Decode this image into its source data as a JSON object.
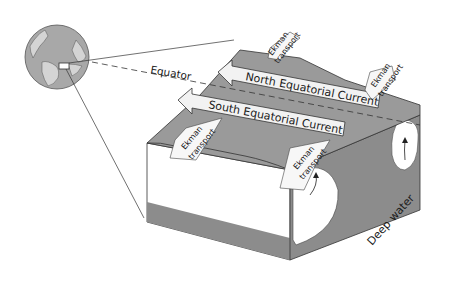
{
  "diagram": {
    "type": "block diagram of equatorial ocean currents with Ekman transport and upwelling",
    "labels": {
      "equator": "Equator",
      "north_current": "North Equatorial Current",
      "south_current": "South Equatorial Current",
      "ekman_1": [
        "Ekman",
        "transport"
      ],
      "ekman_2": [
        "Ekman",
        "transport"
      ],
      "ekman_3": [
        "Ekman",
        "transport"
      ],
      "ekman_4": [
        "Ekman",
        "transport"
      ],
      "deep_water": "Deep water"
    },
    "colors": {
      "surface_gray": "#9a9a9a",
      "side_gray": "#8c8c8c",
      "arrow_fill": "#f2f2f2",
      "outline": "#333333",
      "globe_ocean": "#a8a8a8",
      "globe_land": "#d4d4d4"
    }
  }
}
